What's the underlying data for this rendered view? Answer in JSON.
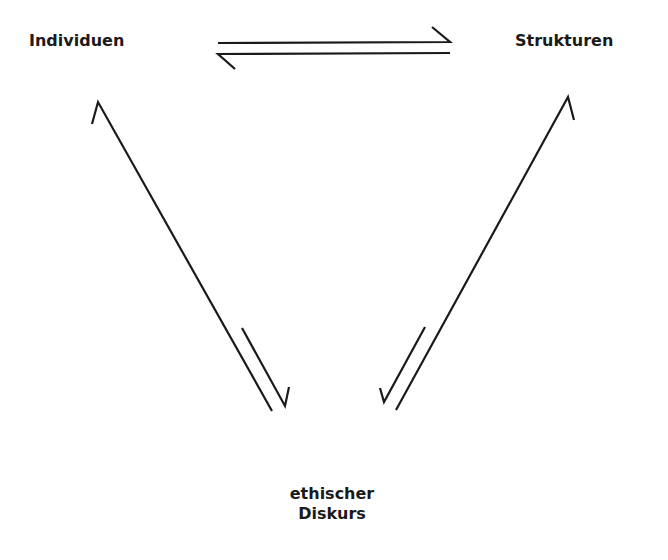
{
  "diagram": {
    "type": "triangular-relationship",
    "nodes": [
      {
        "id": "individuen",
        "label": "Individuen",
        "position": "top-left"
      },
      {
        "id": "strukturen",
        "label": "Strukturen",
        "position": "top-right"
      },
      {
        "id": "diskurs",
        "label_line1": "ethischer",
        "label_line2": "Diskurs",
        "position": "bottom-center"
      }
    ],
    "edges": [
      {
        "from": "individuen",
        "to": "strukturen",
        "style": "harpoon-equilibrium",
        "direction": "bidirectional"
      },
      {
        "from": "diskurs",
        "to": "individuen",
        "style": "harpoon-equilibrium",
        "direction": "bidirectional"
      },
      {
        "from": "diskurs",
        "to": "strukturen",
        "style": "harpoon-equilibrium",
        "direction": "bidirectional"
      }
    ],
    "colors": {
      "stroke": "#1a1a1a",
      "background": "#ffffff",
      "text": "#1a1a1a"
    }
  }
}
